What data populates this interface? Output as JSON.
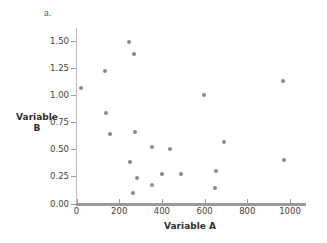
{
  "figure": {
    "panel_label": "a.",
    "marker_color": "#8b8b8b",
    "axis_color": "#9a9a9a"
  },
  "chart_data": {
    "type": "scatter",
    "title": "",
    "subtitle": "",
    "xlabel": "Variable A",
    "ylabel": "Variable B",
    "ylabel_lines": [
      "Variable",
      "B"
    ],
    "xlim": [
      0,
      1100
    ],
    "ylim": [
      0,
      1.62
    ],
    "xticks": [
      0,
      200,
      400,
      600,
      800,
      1000
    ],
    "xtick_labels": [
      "0",
      "200",
      "400",
      "600",
      "800",
      "1000"
    ],
    "yticks": [
      0.0,
      0.25,
      0.5,
      0.75,
      1.0,
      1.25,
      1.5
    ],
    "ytick_labels": [
      "0.00",
      "0.25",
      "0.50",
      "0.75",
      "1.00",
      "1.25",
      "1.50"
    ],
    "grid": false,
    "legend": null,
    "series": [
      {
        "name": "Variable B vs Variable A",
        "points": [
          {
            "x": 20,
            "y": 1.07
          },
          {
            "x": 135,
            "y": 1.22
          },
          {
            "x": 140,
            "y": 0.84
          },
          {
            "x": 155,
            "y": 0.64
          },
          {
            "x": 248,
            "y": 1.49
          },
          {
            "x": 268,
            "y": 1.38
          },
          {
            "x": 272,
            "y": 0.66
          },
          {
            "x": 252,
            "y": 0.38
          },
          {
            "x": 283,
            "y": 0.24
          },
          {
            "x": 265,
            "y": 0.1
          },
          {
            "x": 352,
            "y": 0.52
          },
          {
            "x": 355,
            "y": 0.17
          },
          {
            "x": 400,
            "y": 0.27
          },
          {
            "x": 440,
            "y": 0.5
          },
          {
            "x": 490,
            "y": 0.27
          },
          {
            "x": 597,
            "y": 1.0
          },
          {
            "x": 652,
            "y": 0.3
          },
          {
            "x": 650,
            "y": 0.14
          },
          {
            "x": 690,
            "y": 0.57
          },
          {
            "x": 968,
            "y": 1.13
          },
          {
            "x": 970,
            "y": 0.4
          }
        ]
      }
    ]
  }
}
